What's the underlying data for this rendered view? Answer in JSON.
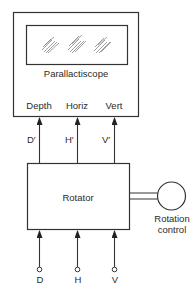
{
  "diagram": {
    "parallactiscope": {
      "title": "Parallactiscope",
      "inputs": [
        {
          "label": "Depth"
        },
        {
          "label": "Horiz"
        },
        {
          "label": "Vert"
        }
      ]
    },
    "signals": [
      {
        "label": "D′"
      },
      {
        "label": "H′"
      },
      {
        "label": "V′"
      }
    ],
    "rotator": {
      "title": "Rotator"
    },
    "rotation_control": {
      "line1": "Rotation",
      "line2": "control"
    },
    "terminals": [
      {
        "label": "D"
      },
      {
        "label": "H"
      },
      {
        "label": "V"
      }
    ],
    "colors": {
      "line": "#333333",
      "hatch": "#666666"
    }
  }
}
